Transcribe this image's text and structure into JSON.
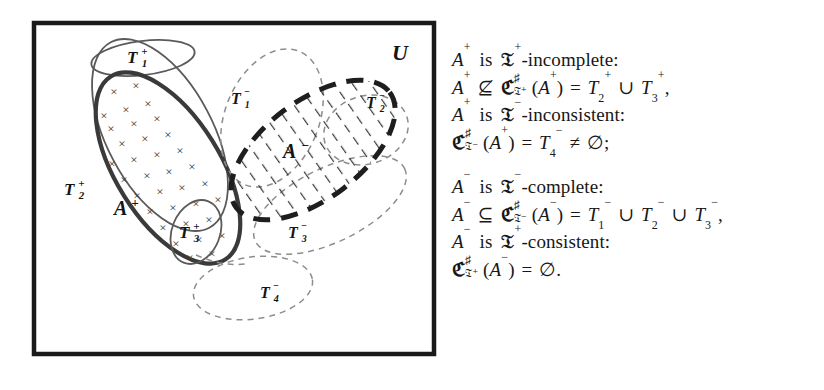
{
  "figure": {
    "universe_label": "U",
    "positive_cluster": {
      "set_a_label": "A",
      "set_a_sign": "+",
      "theories": [
        {
          "name": "T",
          "index": "1",
          "sign": "+"
        },
        {
          "name": "T",
          "index": "2",
          "sign": "+"
        },
        {
          "name": "T",
          "index": "3",
          "sign": "+"
        }
      ],
      "fill_marker": "×",
      "marker_count": 36
    },
    "negative_cluster": {
      "set_a_label": "A",
      "set_a_sign": "−",
      "theories": [
        {
          "name": "T",
          "index": "1",
          "sign": "−"
        },
        {
          "name": "T",
          "index": "2",
          "sign": "−"
        },
        {
          "name": "T",
          "index": "3",
          "sign": "−"
        },
        {
          "name": "T",
          "index": "4",
          "sign": "−"
        }
      ]
    },
    "colors": {
      "frame": "#1a1a1a",
      "solid_thin": "#555555",
      "solid_bold": "#3a3a3a",
      "dashed_thin": "#8d8d8d",
      "dashed_bold": "#222222",
      "hatch": "#3a3a3a",
      "text": "#141414"
    }
  },
  "formulas": {
    "lines": [
      {
        "id": "line-1",
        "text": "A+ is ᵑ7+-incomplete:",
        "parts": [
          {
            "kind": "var",
            "base": "A",
            "sup": "+"
          },
          {
            "kind": "word",
            "text": "is"
          },
          {
            "kind": "frak",
            "base": "𝔗",
            "sup": "+"
          },
          {
            "kind": "word",
            "text": "-incomplete:"
          }
        ]
      },
      {
        "id": "line-2",
        "text": "A+ ⊈ ℭ♯_{ᵑ7+}(A+) = T2+ ∪ T3+,",
        "parts": [
          {
            "kind": "var",
            "base": "A",
            "sup": "+"
          },
          {
            "kind": "op",
            "text": "⊈"
          },
          {
            "kind": "frakC",
            "sup": "♯",
            "sub": "𝔗+"
          },
          {
            "kind": "word",
            "text": "("
          },
          {
            "kind": "var",
            "base": "A",
            "sup": "+"
          },
          {
            "kind": "word",
            "text": ")"
          },
          {
            "kind": "op",
            "text": "="
          },
          {
            "kind": "var",
            "base": "T",
            "sub": "2",
            "sup": "+"
          },
          {
            "kind": "op",
            "text": "∪"
          },
          {
            "kind": "var",
            "base": "T",
            "sub": "3",
            "sup": "+"
          },
          {
            "kind": "word",
            "text": ","
          }
        ]
      },
      {
        "id": "line-3",
        "text": "A+ is ᵑ7−-inconsistent:",
        "parts": [
          {
            "kind": "var",
            "base": "A",
            "sup": "+"
          },
          {
            "kind": "word",
            "text": "is"
          },
          {
            "kind": "frak",
            "base": "𝔗",
            "sup": "−"
          },
          {
            "kind": "word",
            "text": "-inconsistent:"
          }
        ]
      },
      {
        "id": "line-4",
        "text": "ℭ♯_{ᵑ7−}(A+) = T4− ≠ ∅;",
        "parts": [
          {
            "kind": "frakC",
            "sup": "♯",
            "sub": "𝔗−"
          },
          {
            "kind": "word",
            "text": "("
          },
          {
            "kind": "var",
            "base": "A",
            "sup": "+"
          },
          {
            "kind": "word",
            "text": ")"
          },
          {
            "kind": "op",
            "text": "="
          },
          {
            "kind": "var",
            "base": "T",
            "sub": "4",
            "sup": "−"
          },
          {
            "kind": "op",
            "text": "≠"
          },
          {
            "kind": "word",
            "text": "∅;"
          }
        ]
      },
      {
        "id": "line-5",
        "text": "A− is ᵑ7−-complete:",
        "parts": [
          {
            "kind": "var",
            "base": "A",
            "sup": "−"
          },
          {
            "kind": "word",
            "text": "is"
          },
          {
            "kind": "frak",
            "base": "𝔗",
            "sup": "−"
          },
          {
            "kind": "word",
            "text": "-complete:"
          }
        ]
      },
      {
        "id": "line-6",
        "text": "A− ⊆ ℭ♯_{ᵑ7−}(A−) = T1− ∪ T2− ∪ T3−,",
        "parts": []
      },
      {
        "id": "line-7",
        "text": "A− is ᵑ7+-consistent:",
        "parts": []
      },
      {
        "id": "line-8",
        "text": "ℭ♯_{ᵑ7+}(A−) = ∅.",
        "parts": []
      }
    ]
  }
}
